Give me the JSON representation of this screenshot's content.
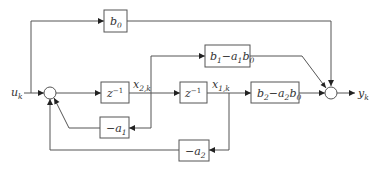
{
  "diagram": {
    "type": "signal-flow block diagram",
    "input_label": {
      "base": "u",
      "sub": "k"
    },
    "output_label": {
      "base": "y",
      "sub": "k"
    },
    "blocks": {
      "b0": {
        "base": "b",
        "sub": "0"
      },
      "b1_a1b0": {
        "p1": "b",
        "s1": "1",
        "op": "−",
        "p2": "a",
        "s2": "1",
        "p3": "b",
        "s3": "0"
      },
      "z_inv_1": {
        "base": "z",
        "sup": "−1"
      },
      "z_inv_2": {
        "base": "z",
        "sup": "−1"
      },
      "b2_a2b0": {
        "p1": "b",
        "s1": "2",
        "op": "−",
        "p2": "a",
        "s2": "2",
        "p3": "b",
        "s3": "0"
      },
      "neg_a1": {
        "base": "−a",
        "sub": "1"
      },
      "neg_a2": {
        "base": "−a",
        "sub": "2"
      }
    },
    "state_labels": {
      "x2k": {
        "base": "x",
        "sub": "2,k"
      },
      "x1k": {
        "base": "x",
        "sub": "1,k"
      }
    },
    "summing_junctions": [
      "input-sum",
      "output-sum"
    ],
    "colors": {
      "line": "#555555",
      "arrow": "#222222",
      "text": "#333333",
      "background": "#ffffff"
    }
  }
}
